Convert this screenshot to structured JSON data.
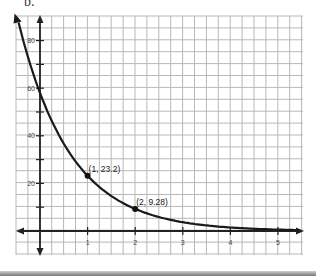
{
  "problem_label": "b.",
  "chart_data": {
    "type": "line",
    "title": "",
    "xlabel": "",
    "ylabel": "",
    "function": "y = 58(0.4)^x",
    "x_ticks": [
      "1",
      "2",
      "3",
      "4",
      "5"
    ],
    "y_ticks": [
      "20",
      "40",
      "60",
      "80"
    ],
    "xlim": [
      -0.5,
      5.5
    ],
    "ylim": [
      -10,
      90
    ],
    "grid": true,
    "x": [
      -0.45,
      0,
      0.5,
      1,
      1.5,
      2,
      3,
      4,
      5,
      5.4
    ],
    "values": [
      87.1,
      58,
      36.7,
      23.2,
      14.7,
      9.28,
      3.71,
      1.48,
      0.59,
      0.41
    ],
    "labeled_points": [
      {
        "x": 1,
        "y": 23.2,
        "label": "(1, 23.2)"
      },
      {
        "x": 2,
        "y": 9.28,
        "label": "(2, 9.28)"
      }
    ],
    "colors": {
      "grid": "#b8b8b8",
      "axis": "#222222",
      "curve": "#1a1a1a"
    }
  }
}
